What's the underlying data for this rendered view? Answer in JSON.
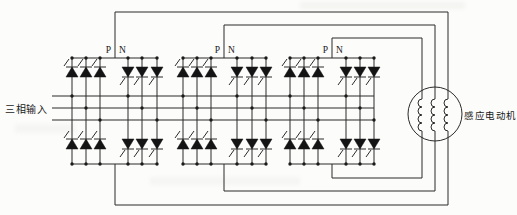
{
  "labels": {
    "three_phase_input": "三相输入",
    "induction_motor": "感应电动机",
    "positive_group": "P",
    "negative_group": "N"
  },
  "structure": {
    "converter_groups": 3,
    "legs_per_group": 6,
    "thyristors_per_leg": 2,
    "total_thyristors": 36,
    "input_phases": 3,
    "motor_windings": 3
  },
  "colors": {
    "line": "#2b2b2b",
    "device_fill": "#141414",
    "background": "#fcfcfa",
    "text": "#1a1a1a"
  }
}
